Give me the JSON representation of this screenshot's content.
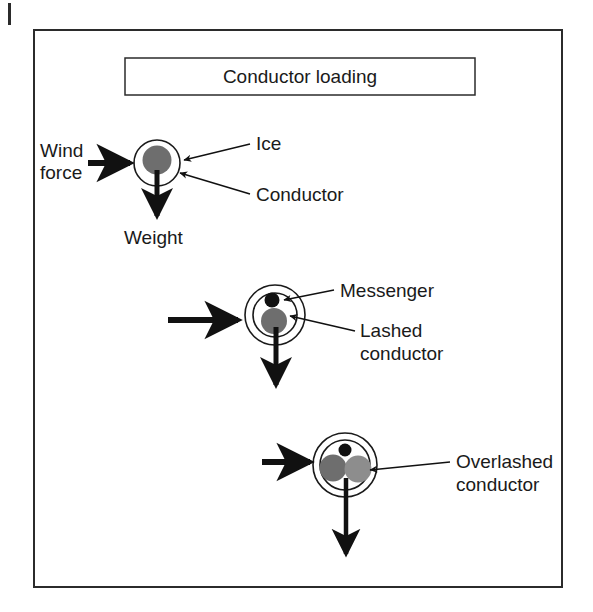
{
  "figure": {
    "title": "Conductor loading",
    "frame": {
      "x": 34,
      "y": 30,
      "width": 528,
      "height": 557,
      "stroke": "#2b2b2b",
      "stroke_width": 2
    },
    "title_box": {
      "x": 125,
      "y": 58,
      "width": 350,
      "height": 37,
      "stroke": "#2b2b2b",
      "stroke_width": 1.5
    },
    "corner_mark": {
      "x": 8,
      "y": 3,
      "width": 3,
      "height": 22
    },
    "colors": {
      "ink": "#1a1a1a",
      "frame": "#2b2b2b",
      "conductor_gray": "#6e6e6e",
      "conductor_gray_light": "#8d8d8d",
      "messenger_black": "#111111",
      "ice_fill": "#ffffff",
      "background": "#ffffff"
    },
    "diagrams": [
      {
        "id": "single-conductor",
        "name": "ice-covered-conductor",
        "center": {
          "x": 157,
          "y": 163
        },
        "circles": [
          {
            "name": "ice-circle",
            "r": 23,
            "fill": "#ffffff",
            "stroke": "#1a1a1a",
            "stroke_width": 1.6
          }
        ],
        "discs": [
          {
            "name": "conductor-disc",
            "cx": 157,
            "cy": 160,
            "r": 14.5,
            "fill": "#6e6e6e"
          }
        ],
        "wind_arrow": {
          "x1": 88,
          "y1": 163,
          "x2": 132,
          "y2": 163
        },
        "weight_arrow": {
          "x1": 157,
          "y1": 170,
          "x2": 157,
          "y2": 221
        },
        "labels": [
          {
            "name": "wind-force-label",
            "text": "Wind force",
            "lines": [
              "Wind",
              "force"
            ],
            "x": 40,
            "y": 150,
            "anchor": "start"
          },
          {
            "name": "weight-label",
            "text": "Weight",
            "lines": [
              "Weight"
            ],
            "x": 126,
            "y": 243,
            "anchor": "start"
          },
          {
            "name": "ice-label",
            "text": "Ice",
            "lines": [
              "Ice"
            ],
            "x": 256,
            "y": 148,
            "anchor": "start"
          },
          {
            "name": "conductor-label",
            "text": "Conductor",
            "lines": [
              "Conductor"
            ],
            "x": 256,
            "y": 200,
            "anchor": "start"
          }
        ],
        "leaders": [
          {
            "name": "ice-leader",
            "x1": 250,
            "y1": 144,
            "x2": 184,
            "y2": 160
          },
          {
            "name": "conductor-leader",
            "x1": 250,
            "y1": 194,
            "x2": 180,
            "y2": 172
          }
        ]
      },
      {
        "id": "lashed-conductor",
        "name": "lashed-conductor-bundle",
        "center": {
          "x": 275,
          "y": 315
        },
        "circles": [
          {
            "name": "ice-circle-outer",
            "r": 30,
            "fill": "#ffffff",
            "stroke": "#1a1a1a",
            "stroke_width": 1.6
          },
          {
            "name": "ice-circle-inner",
            "r": 22,
            "fill": "#ffffff",
            "stroke": "#1a1a1a",
            "stroke_width": 1.6
          }
        ],
        "discs": [
          {
            "name": "messenger-disc",
            "cx": 272,
            "cy": 300,
            "r": 7.5,
            "fill": "#111111"
          },
          {
            "name": "lashed-conductor-disc",
            "cx": 274,
            "cy": 321,
            "r": 13,
            "fill": "#6e6e6e"
          }
        ],
        "wind_arrow": {
          "x1": 168,
          "y1": 320,
          "x2": 240,
          "y2": 320
        },
        "weight_arrow": {
          "x1": 276,
          "y1": 327,
          "x2": 276,
          "y2": 390
        },
        "labels": [
          {
            "name": "messenger-label",
            "text": "Messenger",
            "lines": [
              "Messenger"
            ],
            "x": 340,
            "y": 296,
            "anchor": "start"
          },
          {
            "name": "lashed-conductor-label",
            "text": "Lashed conductor",
            "lines": [
              "Lashed",
              "conductor"
            ],
            "x": 360,
            "y": 334,
            "anchor": "start"
          }
        ],
        "leaders": [
          {
            "name": "messenger-leader",
            "x1": 334,
            "y1": 290,
            "x2": 286,
            "y2": 300
          },
          {
            "name": "lashed-conductor-leader",
            "x1": 355,
            "y1": 330,
            "x2": 292,
            "y2": 316
          }
        ]
      },
      {
        "id": "overlashed-conductor",
        "name": "overlashed-conductor-bundle",
        "center": {
          "x": 345,
          "y": 465
        },
        "circles": [
          {
            "name": "ice-circle-outer",
            "r": 32,
            "fill": "#ffffff",
            "stroke": "#1a1a1a",
            "stroke_width": 1.6
          },
          {
            "name": "ice-circle-inner",
            "r": 25,
            "fill": "#ffffff",
            "stroke": "#1a1a1a",
            "stroke_width": 1.6
          }
        ],
        "discs": [
          {
            "name": "messenger-disc",
            "cx": 345,
            "cy": 450,
            "r": 6.5,
            "fill": "#111111"
          },
          {
            "name": "conductor-disc-left",
            "cx": 333,
            "cy": 468,
            "r": 13.5,
            "fill": "#6e6e6e"
          },
          {
            "name": "conductor-disc-right",
            "cx": 358,
            "cy": 469,
            "r": 13.5,
            "fill": "#8d8d8d"
          }
        ],
        "wind_arrow": {
          "x1": 262,
          "y1": 462,
          "x2": 312,
          "y2": 462
        },
        "weight_arrow": {
          "x1": 346,
          "y1": 478,
          "x2": 346,
          "y2": 560
        },
        "labels": [
          {
            "name": "overlashed-conductor-label",
            "text": "Overlashed conductor",
            "lines": [
              "Overlashed",
              "conductor"
            ],
            "x": 456,
            "y": 465,
            "anchor": "start"
          }
        ],
        "leaders": [
          {
            "name": "overlashed-conductor-leader",
            "x1": 450,
            "y1": 462,
            "x2": 372,
            "y2": 470
          }
        ]
      }
    ]
  }
}
